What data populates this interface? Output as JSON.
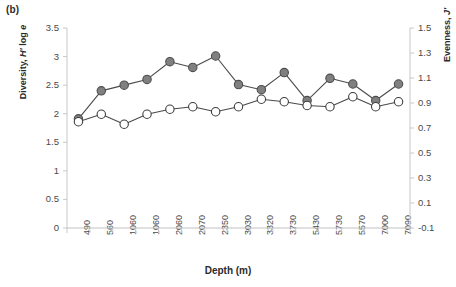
{
  "panel": {
    "label": "(b)"
  },
  "chart_data": {
    "type": "line",
    "title": "",
    "subtitle": "",
    "xlabel": "Depth (m)",
    "ylabel": "Diversity, H' log e",
    "y2label": "Evenness, J'",
    "categories": [
      "490",
      "560",
      "1060",
      "1060",
      "2060",
      "2070",
      "2350",
      "3030",
      "3320",
      "3730",
      "5430",
      "5730",
      "5570",
      "7000",
      "7090"
    ],
    "ylim": [
      0,
      3.5
    ],
    "y2lim": [
      -0.1,
      1.5
    ],
    "yticks": [
      "0",
      "0.5",
      "1",
      "1.5",
      "2",
      "2.5",
      "3",
      "3.5"
    ],
    "ytick_values": [
      0,
      0.5,
      1,
      1.5,
      2,
      2.5,
      3,
      3.5
    ],
    "y2ticks": [
      "-0.1",
      "0.1",
      "0.3",
      "0.5",
      "0.7",
      "0.9",
      "1.1",
      "1.3",
      "1.5"
    ],
    "y2tick_values": [
      -0.1,
      0.1,
      0.3,
      0.5,
      0.7,
      0.9,
      1.1,
      1.3,
      1.5
    ],
    "grid": false,
    "legend": "none",
    "series": [
      {
        "name": "Diversity, H' log e",
        "axis": "left",
        "marker": "filled-circle",
        "color": "#808080",
        "edge_color": "#4d4d4d",
        "values": [
          1.91,
          2.4,
          2.5,
          2.6,
          2.91,
          2.81,
          3.01,
          2.51,
          2.42,
          2.72,
          2.23,
          2.62,
          2.52,
          2.23,
          2.52
        ]
      },
      {
        "name": "Evenness, J'",
        "axis": "right",
        "marker": "open-circle",
        "color": "#ffffff",
        "edge_color": "#3d3d3d",
        "values": [
          0.75,
          0.81,
          0.73,
          0.81,
          0.85,
          0.87,
          0.83,
          0.87,
          0.93,
          0.91,
          0.88,
          0.87,
          0.95,
          0.87,
          0.91
        ]
      }
    ]
  }
}
